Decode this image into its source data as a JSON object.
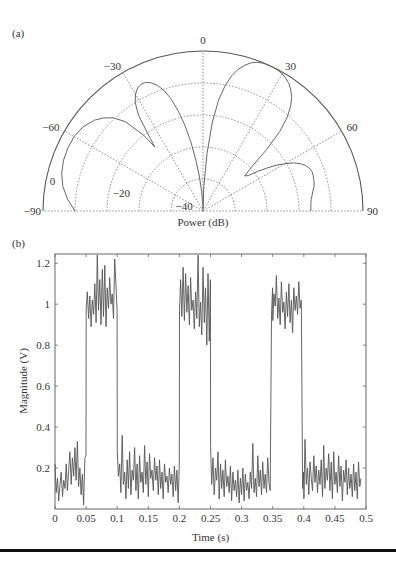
{
  "chart_data": [
    {
      "panel_label": "(a)",
      "type": "polar",
      "title": "",
      "xlabel": "Power (dB)",
      "angle_range_deg": [
        -90,
        90
      ],
      "angle_ticks": [
        -90,
        -60,
        -30,
        0,
        30,
        60,
        90
      ],
      "angle_tick_labels": [
        "−90",
        "−60",
        "−30",
        "0",
        "30",
        "60",
        "90"
      ],
      "radial_range_db": [
        -50,
        0
      ],
      "radial_rings_db": [
        0,
        -10,
        -20,
        -30,
        -40
      ],
      "radial_tick_labels": [
        "0",
        "−20",
        "−40"
      ],
      "radial_tick_values": [
        0,
        -20,
        -40
      ],
      "grid": true,
      "series": [
        {
          "name": "beam pattern",
          "angle_deg": [
            -90,
            -85,
            -80,
            -75,
            -70,
            -65,
            -60,
            -55,
            -50,
            -47,
            -44,
            -41,
            -38,
            -37,
            -36,
            -34,
            -32,
            -30,
            -28,
            -26,
            -24,
            -22,
            -20,
            -18,
            -16,
            -14,
            -12,
            -10,
            -8,
            -6,
            -4,
            -2,
            0,
            2,
            4,
            6,
            8,
            10,
            12,
            14,
            16,
            18,
            20,
            22,
            24,
            26,
            28,
            30,
            32,
            34,
            36,
            38,
            40,
            42,
            44,
            46,
            48,
            50,
            52,
            54,
            56,
            58,
            60,
            62,
            64,
            66,
            68,
            70,
            72,
            74,
            76,
            78,
            80,
            82,
            84,
            86,
            88,
            90
          ],
          "power_db": [
            -10,
            -7.5,
            -5.5,
            -4.3,
            -3.6,
            -3.4,
            -3.5,
            -4.2,
            -5.8,
            -7.4,
            -9.5,
            -13,
            -20,
            -25,
            -22,
            -14,
            -10,
            -7.8,
            -6.5,
            -5.9,
            -6.0,
            -6.8,
            -8.2,
            -10.3,
            -13.4,
            -17.6,
            -22.5,
            -28,
            -34,
            -39,
            -44,
            -48,
            -49.5,
            -42,
            -32,
            -22,
            -15,
            -10.2,
            -6.8,
            -4.3,
            -2.6,
            -1.3,
            -0.55,
            -0.15,
            0,
            -0.05,
            -0.2,
            -0.5,
            -1.1,
            -2.0,
            -3.3,
            -5.0,
            -7.4,
            -10.7,
            -15.5,
            -22.5,
            -30,
            -33,
            -32,
            -29,
            -26,
            -23,
            -20.5,
            -18,
            -16.2,
            -15.0,
            -14.2,
            -13.8,
            -13.8,
            -14.0,
            -14.2,
            -14.6,
            -15.2,
            -15.6,
            -16.0,
            -16.2,
            -16.3,
            -16.3
          ]
        }
      ]
    },
    {
      "panel_label": "(b)",
      "type": "line",
      "title": "",
      "xlabel": "Time (s)",
      "ylabel": "Magnitude (V)",
      "xlim": [
        0,
        0.5
      ],
      "ylim": [
        0,
        1.245
      ],
      "xticks": [
        0,
        0.05,
        0.1,
        0.15,
        0.2,
        0.25,
        0.3,
        0.35,
        0.4,
        0.45,
        0.5
      ],
      "xtick_labels": [
        "0",
        "0.05",
        "0.1",
        "0.15",
        "0.2",
        "0.25",
        "0.3",
        "0.35",
        "0.4",
        "0.45",
        "0.5"
      ],
      "yticks": [
        0.2,
        0.4,
        0.6,
        0.8,
        1,
        1.2
      ],
      "ytick_labels": [
        "0.2",
        "0.4",
        "0.6",
        "0.8",
        "1",
        "1.2"
      ],
      "grid": false,
      "description": "Noisy square wave: low level ~0.13 V, high level ~1.0 V; high between 0.05–0.1 s, 0.2–0.25 s, 0.35–0.4 s",
      "segments": [
        {
          "x_start": 0.0,
          "x_end": 0.05,
          "level": "low",
          "mean": 0.13
        },
        {
          "x_start": 0.05,
          "x_end": 0.1,
          "level": "high",
          "mean": 1.03
        },
        {
          "x_start": 0.1,
          "x_end": 0.2,
          "level": "low",
          "mean": 0.14
        },
        {
          "x_start": 0.2,
          "x_end": 0.25,
          "level": "high",
          "mean": 1.0
        },
        {
          "x_start": 0.25,
          "x_end": 0.35,
          "level": "low",
          "mean": 0.13
        },
        {
          "x_start": 0.35,
          "x_end": 0.4,
          "level": "high",
          "mean": 0.99
        },
        {
          "x_start": 0.4,
          "x_end": 0.5,
          "level": "low",
          "mean": 0.15
        }
      ],
      "series": [
        {
          "name": "signal",
          "x": [
            0.0,
            0.002,
            0.004,
            0.006,
            0.008,
            0.01,
            0.012,
            0.014,
            0.016,
            0.018,
            0.02,
            0.022,
            0.024,
            0.026,
            0.028,
            0.03,
            0.032,
            0.034,
            0.036,
            0.038,
            0.04,
            0.042,
            0.044,
            0.046,
            0.048,
            0.0499,
            0.0501,
            0.052,
            0.054,
            0.056,
            0.058,
            0.06,
            0.062,
            0.064,
            0.066,
            0.068,
            0.07,
            0.072,
            0.074,
            0.076,
            0.078,
            0.08,
            0.082,
            0.084,
            0.086,
            0.088,
            0.09,
            0.092,
            0.094,
            0.096,
            0.098,
            0.0999,
            0.1001,
            0.102,
            0.104,
            0.106,
            0.108,
            0.11,
            0.112,
            0.114,
            0.116,
            0.118,
            0.12,
            0.122,
            0.124,
            0.126,
            0.128,
            0.13,
            0.132,
            0.134,
            0.136,
            0.138,
            0.14,
            0.142,
            0.144,
            0.146,
            0.148,
            0.15,
            0.152,
            0.154,
            0.156,
            0.158,
            0.16,
            0.162,
            0.164,
            0.166,
            0.168,
            0.17,
            0.172,
            0.174,
            0.176,
            0.178,
            0.18,
            0.182,
            0.184,
            0.186,
            0.188,
            0.19,
            0.192,
            0.194,
            0.196,
            0.198,
            0.1999,
            0.2001,
            0.202,
            0.204,
            0.206,
            0.208,
            0.21,
            0.212,
            0.214,
            0.216,
            0.218,
            0.22,
            0.222,
            0.224,
            0.226,
            0.228,
            0.23,
            0.232,
            0.234,
            0.236,
            0.238,
            0.24,
            0.242,
            0.244,
            0.246,
            0.248,
            0.2499,
            0.2501,
            0.252,
            0.254,
            0.256,
            0.258,
            0.26,
            0.262,
            0.264,
            0.266,
            0.268,
            0.27,
            0.272,
            0.274,
            0.276,
            0.278,
            0.28,
            0.282,
            0.284,
            0.286,
            0.288,
            0.29,
            0.292,
            0.294,
            0.296,
            0.298,
            0.3,
            0.302,
            0.304,
            0.306,
            0.308,
            0.31,
            0.312,
            0.314,
            0.316,
            0.318,
            0.32,
            0.322,
            0.324,
            0.326,
            0.328,
            0.33,
            0.332,
            0.334,
            0.336,
            0.338,
            0.34,
            0.342,
            0.344,
            0.346,
            0.348,
            0.3499,
            0.3501,
            0.352,
            0.354,
            0.356,
            0.358,
            0.36,
            0.362,
            0.364,
            0.366,
            0.368,
            0.37,
            0.372,
            0.374,
            0.376,
            0.378,
            0.38,
            0.382,
            0.384,
            0.386,
            0.388,
            0.39,
            0.392,
            0.394,
            0.396,
            0.398,
            0.3999,
            0.4001,
            0.402,
            0.404,
            0.406,
            0.408,
            0.41,
            0.412,
            0.414,
            0.416,
            0.418,
            0.42,
            0.422,
            0.424,
            0.426,
            0.428,
            0.43,
            0.432,
            0.434,
            0.436,
            0.438,
            0.44,
            0.442,
            0.444,
            0.446,
            0.448,
            0.45,
            0.452,
            0.454,
            0.456,
            0.458,
            0.46,
            0.462,
            0.464,
            0.466,
            0.468,
            0.47,
            0.472,
            0.474,
            0.476,
            0.478,
            0.48,
            0.482,
            0.484,
            0.486,
            0.488,
            0.49,
            0.492,
            0.494,
            0.496,
            0.498,
            0.5
          ],
          "y": [
            0.22,
            0.08,
            0.15,
            0.04,
            0.12,
            0.18,
            0.06,
            0.14,
            0.1,
            0.22,
            0.09,
            0.19,
            0.28,
            0.12,
            0.25,
            0.16,
            0.3,
            0.14,
            0.33,
            0.11,
            0.2,
            0.07,
            0.17,
            0.02,
            0.25,
            0.26,
            0.98,
            1.06,
            0.93,
            1.04,
            0.89,
            1.02,
            0.95,
            1.1,
            0.91,
            1.24,
            0.97,
            1.12,
            0.9,
            1.17,
            0.94,
            1.19,
            0.89,
            1.08,
            0.98,
            1.13,
            1.0,
            1.05,
            0.93,
            1.22,
            1.09,
            0.97,
            0.28,
            0.16,
            0.22,
            0.08,
            0.36,
            0.12,
            0.18,
            0.05,
            0.24,
            0.1,
            0.28,
            0.07,
            0.19,
            0.14,
            0.3,
            0.09,
            0.22,
            0.05,
            0.26,
            0.13,
            0.18,
            0.08,
            0.31,
            0.12,
            0.23,
            0.06,
            0.27,
            0.15,
            0.19,
            0.09,
            0.25,
            0.14,
            0.21,
            0.07,
            0.24,
            0.1,
            0.18,
            0.05,
            0.22,
            0.13,
            0.16,
            0.08,
            0.2,
            0.12,
            0.17,
            0.06,
            0.21,
            0.09,
            0.19,
            0.03,
            0.22,
            0.97,
            1.12,
            0.94,
            1.18,
            0.92,
            1.15,
            0.96,
            1.09,
            0.9,
            1.13,
            0.97,
            1.02,
            0.88,
            1.06,
            0.93,
            1.24,
            0.89,
            1.01,
            0.85,
            1.18,
            0.91,
            1.08,
            0.8,
            1.15,
            0.82,
            1.12,
            0.3,
            0.12,
            0.25,
            0.07,
            0.2,
            0.14,
            0.28,
            0.05,
            0.22,
            0.1,
            0.19,
            0.06,
            0.24,
            0.11,
            0.16,
            0.08,
            0.21,
            0.04,
            0.18,
            0.09,
            0.14,
            0.06,
            0.19,
            0.03,
            0.15,
            0.07,
            0.2,
            0.04,
            0.17,
            0.09,
            0.13,
            0.05,
            0.18,
            0.1,
            0.32,
            0.08,
            0.15,
            0.06,
            0.26,
            0.11,
            0.19,
            0.07,
            0.23,
            0.1,
            0.17,
            0.08,
            0.25,
            0.13,
            0.09,
            0.95,
            1.08,
            0.92,
            1.05,
            0.99,
            1.14,
            0.93,
            1.03,
            0.9,
            1.11,
            0.96,
            1.01,
            0.88,
            1.06,
            0.94,
            1.1,
            0.91,
            1.02,
            0.86,
            1.08,
            0.97,
            1.04,
            0.95,
            1.11,
            0.98,
            1.02,
            0.1,
            0.18,
            0.05,
            0.34,
            0.12,
            0.2,
            0.07,
            0.23,
            0.15,
            0.09,
            0.26,
            0.13,
            0.21,
            0.08,
            0.19,
            0.12,
            0.24,
            0.06,
            0.31,
            0.1,
            0.2,
            0.14,
            0.27,
            0.09,
            0.23,
            0.05,
            0.28,
            0.12,
            0.18,
            0.08,
            0.26,
            0.11,
            0.21,
            0.04,
            0.19,
            0.13,
            0.24,
            0.07,
            0.2,
            0.1,
            0.17,
            0.06,
            0.22,
            0.09,
            0.18,
            0.05,
            0.23,
            0.11,
            0.15
          ]
        }
      ]
    }
  ]
}
